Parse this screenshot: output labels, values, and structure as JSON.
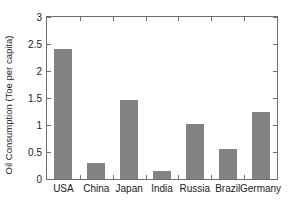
{
  "chart_data": {
    "type": "bar",
    "title": "",
    "xlabel": "",
    "ylabel": "Oil Consumption (Toe per capita)",
    "categories": [
      "USA",
      "China",
      "Japan",
      "India",
      "Russia",
      "Brazil",
      "Germany"
    ],
    "values": [
      2.41,
      0.29,
      1.46,
      0.14,
      1.01,
      0.55,
      1.24
    ],
    "ylim": [
      0,
      3
    ],
    "yticks": [
      "0",
      "0.5",
      "1",
      "1.5",
      "2",
      "2.5",
      "3"
    ],
    "ytick_values": [
      0,
      0.5,
      1,
      1.5,
      2,
      2.5,
      3
    ],
    "grid": false,
    "legend": false,
    "bar_color": "#828282",
    "axis_color": "#6e6e6e",
    "background_color": "#ffffff"
  }
}
